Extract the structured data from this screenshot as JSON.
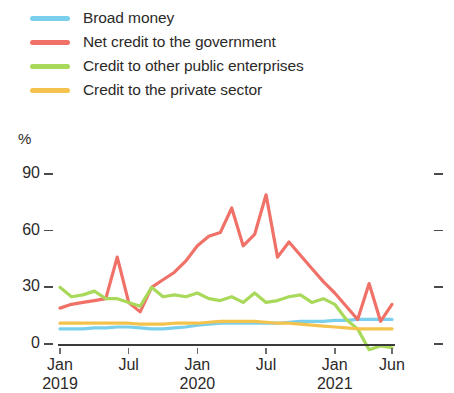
{
  "legend": {
    "position": "top-left",
    "items": [
      {
        "label": "Broad money",
        "color": "#7ACFEC",
        "key": "broad_money"
      },
      {
        "label": "Net credit to the government",
        "color": "#F07167",
        "key": "net_credit_government"
      },
      {
        "label": "Credit to other public enterprises",
        "color": "#A9D95A",
        "key": "credit_other_public"
      },
      {
        "label": "Credit to the private sector",
        "color": "#F3C34E",
        "key": "credit_private_sector"
      }
    ]
  },
  "axes": {
    "y_unit": "%",
    "y_ticks": [
      "0",
      "30",
      "60",
      "90"
    ],
    "x_ticks": [
      {
        "label": "Jan",
        "year": "2019"
      },
      {
        "label": "Jul",
        "year": ""
      },
      {
        "label": "Jan",
        "year": "2020"
      },
      {
        "label": "Jul",
        "year": ""
      },
      {
        "label": "Jan",
        "year": "2021"
      },
      {
        "label": "Jun",
        "year": ""
      }
    ]
  },
  "chart_data": {
    "type": "line",
    "title": "",
    "subtitle": "",
    "xlabel": "",
    "ylabel": "%",
    "ylim": [
      -8,
      92
    ],
    "yticks": [
      0,
      30,
      60,
      90
    ],
    "grid": false,
    "legend_position": "top-left",
    "x": [
      "Jan 2019",
      "Feb 2019",
      "Mar 2019",
      "Apr 2019",
      "May 2019",
      "Jun 2019",
      "Jul 2019",
      "Aug 2019",
      "Sep 2019",
      "Oct 2019",
      "Nov 2019",
      "Dec 2019",
      "Jan 2020",
      "Feb 2020",
      "Mar 2020",
      "Apr 2020",
      "May 2020",
      "Jun 2020",
      "Jul 2020",
      "Aug 2020",
      "Sep 2020",
      "Oct 2020",
      "Nov 2020",
      "Dec 2020",
      "Jan 2021",
      "Feb 2021",
      "Mar 2021",
      "Apr 2021",
      "May 2021",
      "Jun 2021"
    ],
    "x_tick_labels": [
      "Jan 2019",
      "Jul",
      "Jan 2020",
      "Jul",
      "Jan 2021",
      "Jun"
    ],
    "x_tick_indices": [
      0,
      6,
      12,
      18,
      24,
      29
    ],
    "series": [
      {
        "name": "Broad money",
        "color": "#7ACFEC",
        "values": [
          8,
          8,
          8,
          8.5,
          8.5,
          9,
          9,
          8.5,
          8,
          8,
          8.5,
          9,
          10,
          10.5,
          11,
          11,
          11,
          11,
          11,
          11,
          11.5,
          12,
          12,
          12,
          12.5,
          12.5,
          13,
          13,
          13,
          13
        ]
      },
      {
        "name": "Net credit to the government",
        "color": "#F07167",
        "values": [
          19,
          21,
          22,
          23,
          24,
          46,
          22,
          17,
          30,
          34,
          38,
          44,
          52,
          57,
          59,
          72,
          52,
          58,
          79,
          46,
          54,
          47,
          40,
          33,
          27,
          20,
          13,
          32,
          12,
          21
        ]
      },
      {
        "name": "Credit to other public enterprises",
        "color": "#A9D95A",
        "values": [
          30,
          25,
          26,
          28,
          24,
          24,
          22,
          20,
          30,
          25,
          26,
          25,
          27,
          24,
          23,
          25,
          22,
          27,
          22,
          23,
          25,
          26,
          22,
          24,
          21,
          13,
          8,
          -3,
          -1,
          -2
        ]
      },
      {
        "name": "Credit to the private sector",
        "color": "#F3C34E",
        "values": [
          11,
          11,
          11,
          11,
          11,
          11,
          11,
          10.5,
          10.5,
          10.5,
          11,
          11,
          11,
          11.5,
          12,
          12,
          12,
          12,
          11.5,
          11,
          11,
          10.5,
          10,
          9.5,
          9,
          8.5,
          8,
          8,
          8,
          8
        ]
      }
    ]
  }
}
